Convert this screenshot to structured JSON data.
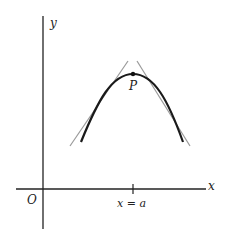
{
  "diagram": {
    "type": "tangent-lines-at-maximum",
    "labels": {
      "y_axis": "y",
      "x_axis": "x",
      "origin": "O",
      "point": "P",
      "tick": "x = a"
    },
    "colors": {
      "axis": "#222222",
      "curve": "#1a1a1a",
      "tangent": "#9a9a9a"
    }
  }
}
